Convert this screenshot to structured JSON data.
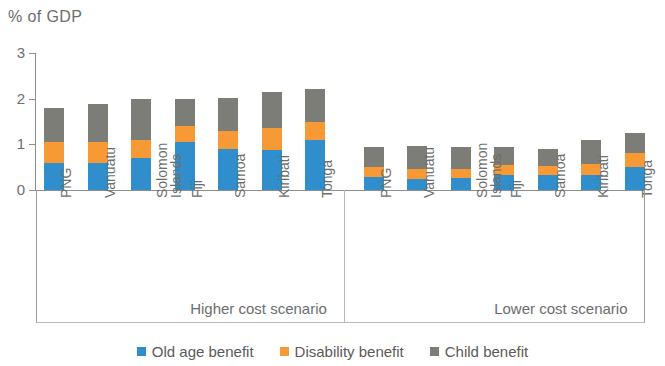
{
  "chart_data": {
    "type": "bar",
    "subtype": "stacked-bar-grouped",
    "title": "",
    "ylabel": "% of GDP",
    "xlabel": "",
    "ylim": [
      0,
      3
    ],
    "y_ticks": [
      "0",
      "1",
      "2",
      "3"
    ],
    "y_tick_values": [
      0,
      1,
      2,
      3
    ],
    "grid": false,
    "legend_position": "bottom-center",
    "categories": [
      "PNG",
      "Vanuatu",
      "Solomon Islands",
      "Fiji",
      "Samoa",
      "Kiribati",
      "Tonga"
    ],
    "groups": [
      {
        "name": "Higher cost scenario",
        "categories": [
          "PNG",
          "Vanuatu",
          "Solomon Islands",
          "Fiji",
          "Samoa",
          "Kiribati",
          "Tonga"
        ],
        "series": [
          {
            "name": "Old age benefit",
            "color": "#2f8ecb",
            "values": [
              0.6,
              0.6,
              0.7,
              1.05,
              0.9,
              0.87,
              1.1
            ]
          },
          {
            "name": "Disability benefit",
            "color": "#f79a36",
            "values": [
              0.45,
              0.45,
              0.4,
              0.35,
              0.4,
              0.48,
              0.38
            ]
          },
          {
            "name": "Child benefit",
            "color": "#7d7d78",
            "values": [
              0.75,
              0.83,
              0.9,
              0.6,
              0.72,
              0.8,
              0.74
            ]
          }
        ],
        "totals": [
          1.8,
          1.88,
          2.0,
          2.0,
          2.02,
          2.15,
          2.22
        ]
      },
      {
        "name": "Lower cost scenario",
        "categories": [
          "PNG",
          "Vanuatu",
          "Solomon Islands",
          "Fiji",
          "Samoa",
          "Kiribati",
          "Tonga"
        ],
        "series": [
          {
            "name": "Old age benefit",
            "color": "#2f8ecb",
            "values": [
              0.28,
              0.25,
              0.27,
              0.33,
              0.32,
              0.33,
              0.5
            ]
          },
          {
            "name": "Disability benefit",
            "color": "#f79a36",
            "values": [
              0.22,
              0.22,
              0.2,
              0.22,
              0.2,
              0.25,
              0.3
            ]
          },
          {
            "name": "Child benefit",
            "color": "#7d7d78",
            "values": [
              0.45,
              0.5,
              0.47,
              0.4,
              0.37,
              0.52,
              0.45
            ]
          }
        ],
        "totals": [
          0.95,
          0.97,
          0.94,
          0.95,
          0.89,
          1.1,
          1.25
        ]
      }
    ],
    "legend": [
      {
        "label": "Old age benefit",
        "color": "#2f8ecb"
      },
      {
        "label": "Disability benefit",
        "color": "#f79a36"
      },
      {
        "label": "Child benefit",
        "color": "#7d7d78"
      }
    ]
  },
  "colors": {
    "old_age": "#2f8ecb",
    "disability": "#f79a36",
    "child": "#7d7d78",
    "axis": "#8e8e8e",
    "text": "#6d6d6d"
  }
}
